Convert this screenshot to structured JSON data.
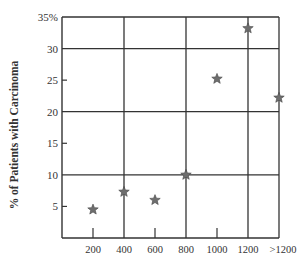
{
  "chart_data": {
    "type": "scatter",
    "title": "",
    "xlabel": "",
    "ylabel": "% of Patients with Carcinoma",
    "categories": [
      "200",
      "400",
      "600",
      "800",
      "1000",
      "1200",
      ">1200"
    ],
    "values": [
      4.5,
      7.3,
      6.0,
      10.0,
      25.2,
      33.2,
      22.2
    ],
    "ylim": [
      0,
      35
    ],
    "y_ticks": [
      "5",
      "10",
      "15",
      "20",
      "25",
      "30",
      "35%"
    ],
    "x_ticks": [
      "200",
      "400",
      "600",
      "800",
      "1000",
      "1200",
      ">1200"
    ],
    "grid": {
      "horizontal": [
        10,
        20,
        30,
        35
      ],
      "vertical": [
        "400",
        "800",
        "1200"
      ]
    },
    "marker": "star",
    "legend": null,
    "colors": {
      "marker": "#6e6e6e",
      "grid": "#333333",
      "axis": "#333333"
    }
  }
}
